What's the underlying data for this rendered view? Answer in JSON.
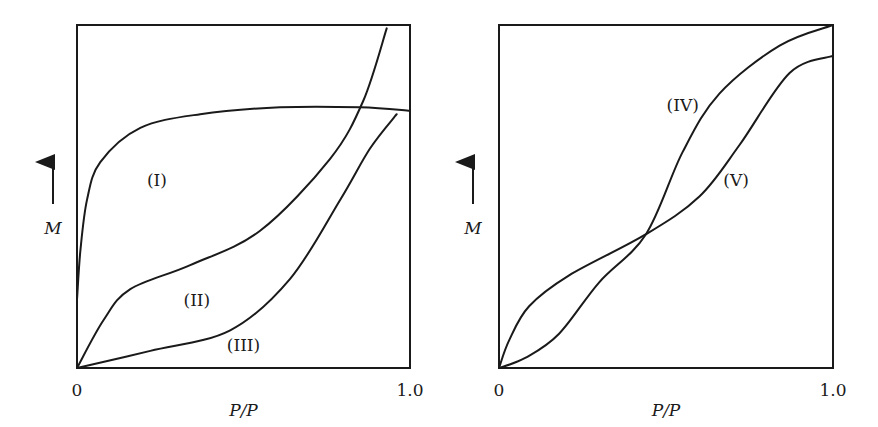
{
  "chart_data": [
    {
      "type": "line",
      "xlabel": "P/P",
      "ylabel": "M",
      "xticks": [
        "0",
        "1.0"
      ],
      "xlim": [
        0,
        1
      ],
      "ylim": [
        0,
        1
      ],
      "series": [
        {
          "name": "(I)",
          "x": [
            0,
            0.01,
            0.03,
            0.07,
            0.19,
            0.37,
            0.61,
            0.85,
            1.0
          ],
          "y": [
            0.2,
            0.34,
            0.49,
            0.6,
            0.7,
            0.74,
            0.76,
            0.76,
            0.75
          ]
        },
        {
          "name": "(II)",
          "x": [
            0,
            0.08,
            0.16,
            0.34,
            0.55,
            0.76,
            0.86,
            0.93
          ],
          "y": [
            0,
            0.14,
            0.23,
            0.3,
            0.4,
            0.61,
            0.78,
            0.99
          ]
        },
        {
          "name": "(III)",
          "x": [
            0,
            0.22,
            0.46,
            0.64,
            0.79,
            0.88,
            0.96
          ],
          "y": [
            0,
            0.05,
            0.11,
            0.26,
            0.49,
            0.64,
            0.74
          ]
        }
      ],
      "labels": [
        {
          "text": "(I)",
          "x": 0.24,
          "y": 0.53
        },
        {
          "text": "(II)",
          "x": 0.36,
          "y": 0.18
        },
        {
          "text": "(III)",
          "x": 0.5,
          "y": 0.05
        }
      ]
    },
    {
      "type": "line",
      "xlabel": "P/P",
      "ylabel": "M",
      "xticks": [
        "0",
        "1.0"
      ],
      "xlim": [
        0,
        1
      ],
      "ylim": [
        0,
        1
      ],
      "series": [
        {
          "name": "(IV)",
          "x": [
            0,
            0.08,
            0.18,
            0.3,
            0.44,
            0.55,
            0.66,
            0.84,
            1.0
          ],
          "y": [
            0,
            0.03,
            0.1,
            0.25,
            0.39,
            0.63,
            0.8,
            0.94,
            1.0
          ]
        },
        {
          "name": "(V)",
          "x": [
            0,
            0.03,
            0.09,
            0.21,
            0.44,
            0.6,
            0.72,
            0.87,
            1.0
          ],
          "y": [
            0,
            0.08,
            0.18,
            0.27,
            0.39,
            0.5,
            0.65,
            0.86,
            0.91
          ]
        }
      ],
      "labels": [
        {
          "text": "(IV)",
          "x": 0.55,
          "y": 0.75
        },
        {
          "text": "(V)",
          "x": 0.71,
          "y": 0.53
        }
      ]
    }
  ]
}
